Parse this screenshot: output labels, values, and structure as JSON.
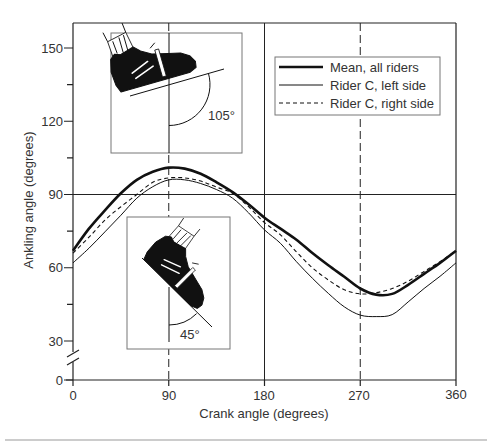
{
  "figure": {
    "legend": {
      "items": [
        {
          "label": "Mean, all riders",
          "line_style": "thick-solid"
        },
        {
          "label": "Rider C, left side",
          "line_style": "thin-solid"
        },
        {
          "label": "Rider C, right side",
          "line_style": "dashed"
        }
      ]
    },
    "insets": [
      {
        "angle_label": "105°",
        "icon": "cycling-shoe-icon"
      },
      {
        "angle_label": "45°",
        "icon": "cycling-shoe-icon"
      }
    ],
    "colors": {
      "line": "#111111",
      "text": "#333333",
      "inset_border": "#777777",
      "background": "#ffffff"
    }
  },
  "chart_data": {
    "type": "line",
    "title": "",
    "xlabel": "Crank angle (degrees)",
    "ylabel": "Ankling angle (degrees)",
    "xlim": [
      0,
      360
    ],
    "ylim": [
      0,
      155
    ],
    "y_axis_break": [
      0,
      30
    ],
    "xticks": [
      0,
      90,
      180,
      270,
      360
    ],
    "yticks": [
      0,
      30,
      60,
      90,
      120,
      150
    ],
    "grid": false,
    "reference_lines": {
      "horizontal_solid": [
        90
      ],
      "vertical_solid": [
        180
      ],
      "vertical_dashed": [
        90,
        270
      ]
    },
    "legend_position": "upper right",
    "annotations": [
      "105°",
      "45°"
    ],
    "x": [
      0,
      15,
      30,
      45,
      60,
      75,
      90,
      105,
      120,
      135,
      150,
      165,
      180,
      195,
      210,
      225,
      240,
      255,
      270,
      285,
      300,
      315,
      330,
      345,
      360
    ],
    "series": [
      {
        "name": "Mean, all riders",
        "style": "thick",
        "values": [
          67,
          76,
          83.5,
          90.5,
          96,
          99.3,
          101,
          100.6,
          98.5,
          95,
          91,
          86,
          80.5,
          76,
          71.5,
          66,
          61,
          56.3,
          51.5,
          49,
          49.3,
          53,
          57.5,
          62,
          67
        ]
      },
      {
        "name": "Rider C, left side",
        "style": "thin",
        "values": [
          62,
          68,
          74.7,
          81.5,
          88.5,
          93.2,
          96,
          96,
          94.5,
          92,
          88.5,
          82.5,
          75.5,
          70,
          62.5,
          55.7,
          49.5,
          44,
          40.6,
          40,
          40.8,
          46,
          51.5,
          56.5,
          62
        ]
      },
      {
        "name": "Rider C, right side",
        "style": "dashed",
        "values": [
          66,
          72.5,
          79.5,
          85,
          90,
          95,
          96.8,
          96.8,
          95.5,
          93,
          90.5,
          85,
          78.5,
          73.5,
          66.5,
          60,
          55,
          51,
          49.3,
          49.8,
          51.5,
          54.5,
          58.5,
          62.5,
          67
        ]
      }
    ]
  }
}
